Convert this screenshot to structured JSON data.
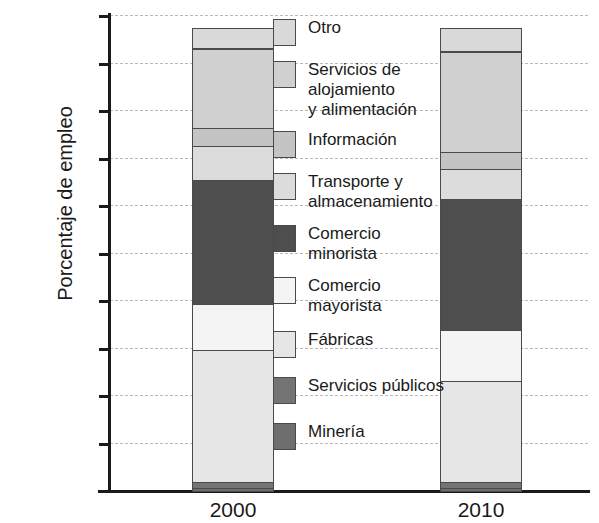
{
  "chart_data": {
    "type": "bar",
    "title": "",
    "xlabel": "",
    "ylabel": "Porcentaje de empleo",
    "ylim": [
      0,
      100
    ],
    "grid": true,
    "stacked": true,
    "percent_axis": true,
    "legend_position": "inside-right",
    "categories": [
      "2000",
      "2010"
    ],
    "ytick_labels": [
      "100%",
      "90%",
      "80%",
      "70%",
      "60%",
      "50%",
      "40%",
      "30%",
      "20%",
      "10%",
      "0%"
    ],
    "ytick_values": [
      100,
      90,
      80,
      70,
      60,
      50,
      40,
      30,
      20,
      10,
      0
    ],
    "series": [
      {
        "name": "Otro",
        "color": "#d9d9d9",
        "values": [
          4.5,
          5.0
        ]
      },
      {
        "name": "Servicios de\nalojamiento\ny alimentación",
        "color": "#d0d0d0",
        "values": [
          17.0,
          21.5
        ]
      },
      {
        "name": "Información",
        "color": "#c4c4c4",
        "values": [
          4.0,
          4.0
        ]
      },
      {
        "name": "Transporte y\nalmacenamiento",
        "color": "#dcdcdc",
        "values": [
          7.5,
          6.5
        ]
      },
      {
        "name": "Comercio\nminorista",
        "color": "#4e4e4e",
        "values": [
          26.5,
          28.0
        ]
      },
      {
        "name": "Comercio\nmayorista",
        "color": "#f4f4f4",
        "values": [
          10.0,
          11.0
        ]
      },
      {
        "name": "Fábricas",
        "color": "#e6e6e6",
        "values": [
          28.2,
          21.7
        ]
      },
      {
        "name": "Servicios públicos",
        "color": "#747474",
        "values": [
          1.5,
          1.5
        ]
      },
      {
        "name": "Minería",
        "color": "#6e6e6e",
        "values": [
          0.8,
          0.8
        ]
      }
    ]
  },
  "axis": {
    "y_title": "Porcentaje de empleo"
  }
}
